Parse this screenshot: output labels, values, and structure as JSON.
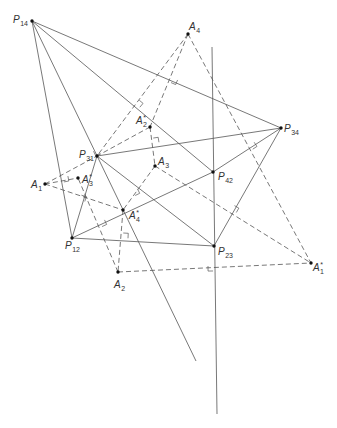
{
  "figure": {
    "background": "#ffffff",
    "line_color": "#555555",
    "point_color": "#111111",
    "width": 337,
    "height": 428
  },
  "diagram": {
    "points": [
      {
        "id": "P14",
        "x": 32,
        "y": 21,
        "letter": "P",
        "sub": "14",
        "star": false,
        "lx": 13,
        "ly": 23
      },
      {
        "id": "A4",
        "x": 188,
        "y": 34,
        "letter": "A",
        "sub": "4",
        "star": false,
        "lx": 189,
        "ly": 30
      },
      {
        "id": "A2s",
        "x": 150,
        "y": 127,
        "letter": "A",
        "sub": "2",
        "star": true,
        "lx": 136,
        "ly": 124
      },
      {
        "id": "P34",
        "x": 281,
        "y": 128,
        "letter": "P",
        "sub": "34",
        "star": false,
        "lx": 284,
        "ly": 132
      },
      {
        "id": "P31",
        "x": 97,
        "y": 156,
        "letter": "P",
        "sub": "31",
        "star": false,
        "lx": 79,
        "ly": 158
      },
      {
        "id": "A3",
        "x": 155,
        "y": 166,
        "letter": "A",
        "sub": "3",
        "star": false,
        "lx": 158,
        "ly": 165
      },
      {
        "id": "A1",
        "x": 45,
        "y": 184,
        "letter": "A",
        "sub": "1",
        "star": false,
        "lx": 31,
        "ly": 188
      },
      {
        "id": "A3s",
        "x": 78,
        "y": 178,
        "letter": "A",
        "sub": "3",
        "star": true,
        "lx": 82,
        "ly": 183
      },
      {
        "id": "P42",
        "x": 213,
        "y": 172,
        "letter": "P",
        "sub": "42",
        "star": false,
        "lx": 218,
        "ly": 180
      },
      {
        "id": "A4s",
        "x": 123,
        "y": 210,
        "letter": "A",
        "sub": "4",
        "star": true,
        "lx": 129,
        "ly": 219
      },
      {
        "id": "P12",
        "x": 72,
        "y": 238,
        "letter": "P",
        "sub": "12",
        "star": false,
        "lx": 65,
        "ly": 249
      },
      {
        "id": "P23",
        "x": 214,
        "y": 246,
        "letter": "P",
        "sub": "23",
        "star": false,
        "lx": 218,
        "ly": 255
      },
      {
        "id": "A1s",
        "x": 311,
        "y": 263,
        "letter": "A",
        "sub": "1",
        "star": true,
        "lx": 313,
        "ly": 271
      },
      {
        "id": "A2",
        "x": 118,
        "y": 272,
        "letter": "A",
        "sub": "2",
        "star": false,
        "lx": 114,
        "ly": 288
      }
    ],
    "aux_points": [
      {
        "id": "END1",
        "x": 196,
        "y": 361
      },
      {
        "id": "V1",
        "x": 212,
        "y": 47
      },
      {
        "id": "V2",
        "x": 217,
        "y": 414
      }
    ],
    "segments": [
      {
        "from": "P14",
        "to": "P34",
        "style": "solid"
      },
      {
        "from": "P14",
        "to": "P12",
        "style": "solid"
      },
      {
        "from": "P14",
        "to": "P42",
        "style": "solid"
      },
      {
        "from": "P14",
        "to": "END1",
        "style": "solid"
      },
      {
        "from": "P31",
        "to": "P34",
        "style": "solid"
      },
      {
        "from": "P31",
        "to": "P12",
        "style": "solid"
      },
      {
        "from": "P31",
        "to": "P23",
        "style": "solid"
      },
      {
        "from": "P12",
        "to": "P23",
        "style": "solid"
      },
      {
        "from": "P12",
        "to": "P42",
        "style": "solid"
      },
      {
        "from": "P42",
        "to": "P34",
        "style": "solid"
      },
      {
        "from": "P23",
        "to": "P34",
        "style": "solid"
      },
      {
        "from": "V1",
        "to": "V2",
        "style": "solid"
      },
      {
        "from": "A4",
        "to": "P31",
        "style": "dashed"
      },
      {
        "from": "A4",
        "to": "A2s",
        "style": "dashed"
      },
      {
        "from": "A2s",
        "to": "A3",
        "style": "dashed"
      },
      {
        "from": "A2s",
        "to": "P31",
        "style": "dashed"
      },
      {
        "from": "A4",
        "to": "A1s",
        "style": "dashed"
      },
      {
        "from": "A3",
        "to": "A1s",
        "style": "dashed"
      },
      {
        "from": "A3",
        "to": "A4s",
        "style": "dashed"
      },
      {
        "from": "A1",
        "to": "P31",
        "style": "dashed"
      },
      {
        "from": "A1",
        "to": "A3s",
        "style": "dashed"
      },
      {
        "from": "A1",
        "to": "A4s",
        "style": "dashed"
      },
      {
        "from": "A4s",
        "to": "A2",
        "style": "dashed"
      },
      {
        "from": "A2",
        "to": "A3s",
        "style": "dashed"
      },
      {
        "from": "A2",
        "to": "A1s",
        "style": "dashed"
      }
    ],
    "right_angle_markers": [
      {
        "x": 173,
        "y": 78,
        "angle": 23.3,
        "side": 1
      },
      {
        "x": 136,
        "y": 104,
        "angle": 40.0,
        "side": -1
      },
      {
        "x": 154,
        "y": 143,
        "angle": -8.7,
        "side": -1
      },
      {
        "x": 63,
        "y": 177,
        "angle": 79.6,
        "side": -1
      },
      {
        "x": 80,
        "y": 200,
        "angle": -73.1,
        "side": 1
      },
      {
        "x": 133,
        "y": 191,
        "angle": 64.1,
        "side": -1
      },
      {
        "x": 100,
        "y": 222,
        "angle": -24.7,
        "side": 1
      },
      {
        "x": 123,
        "y": 238,
        "angle": 3.2,
        "side": -1
      },
      {
        "x": 250,
        "y": 145,
        "angle": -33.3,
        "side": 1
      },
      {
        "x": 232,
        "y": 210,
        "angle": -60.4,
        "side": 1
      },
      {
        "x": 213,
        "y": 266,
        "angle": 89.3,
        "side": 1
      },
      {
        "x": 98,
        "y": 149,
        "angle": 64.1,
        "side": 1
      }
    ]
  }
}
